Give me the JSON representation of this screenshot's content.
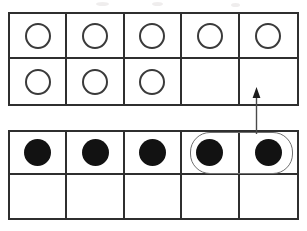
{
  "diagram": {
    "background_color": "#ffffff",
    "line_color": "#2f2f2f",
    "counter_fill_color": "#121212",
    "counter_outline_color": "#3a3a3a",
    "lasso_color": "#6e6e6e",
    "arrow_color": "#2a2a2a"
  },
  "top_frame": {
    "name": "top-ten-frame",
    "columns": 5,
    "rows": 2,
    "open_counter_count": 8,
    "empty_cell_count": 2,
    "cells": [
      {
        "row": 1,
        "col": 1,
        "counter": "open"
      },
      {
        "row": 1,
        "col": 2,
        "counter": "open"
      },
      {
        "row": 1,
        "col": 3,
        "counter": "open"
      },
      {
        "row": 1,
        "col": 4,
        "counter": "open"
      },
      {
        "row": 1,
        "col": 5,
        "counter": "open"
      },
      {
        "row": 2,
        "col": 1,
        "counter": "open"
      },
      {
        "row": 2,
        "col": 2,
        "counter": "open"
      },
      {
        "row": 2,
        "col": 3,
        "counter": "open"
      },
      {
        "row": 2,
        "col": 4,
        "counter": "none"
      },
      {
        "row": 2,
        "col": 5,
        "counter": "none"
      }
    ]
  },
  "bottom_frame": {
    "name": "bottom-ten-frame",
    "columns": 5,
    "rows": 2,
    "filled_counter_count": 5,
    "empty_cell_count": 5,
    "cells": [
      {
        "row": 1,
        "col": 1,
        "counter": "filled"
      },
      {
        "row": 1,
        "col": 2,
        "counter": "filled"
      },
      {
        "row": 1,
        "col": 3,
        "counter": "filled"
      },
      {
        "row": 1,
        "col": 4,
        "counter": "filled"
      },
      {
        "row": 1,
        "col": 5,
        "counter": "filled"
      },
      {
        "row": 2,
        "col": 1,
        "counter": "none"
      },
      {
        "row": 2,
        "col": 2,
        "counter": "none"
      },
      {
        "row": 2,
        "col": 3,
        "counter": "none"
      },
      {
        "row": 2,
        "col": 4,
        "counter": "none"
      },
      {
        "row": 2,
        "col": 5,
        "counter": "none"
      }
    ]
  },
  "selection": {
    "name": "lasso-selection",
    "shape": "rounded-rectangle",
    "selected_cells": [
      {
        "frame": "bottom",
        "row": 1,
        "col": 4
      },
      {
        "frame": "bottom",
        "row": 1,
        "col": 5
      }
    ],
    "selected_count": 2
  },
  "arrow": {
    "name": "move-arrow",
    "direction": "up",
    "from": "bottom-frame-selection",
    "to": "top-frame-row2-col5"
  },
  "artifacts": {
    "smudges": 3
  }
}
